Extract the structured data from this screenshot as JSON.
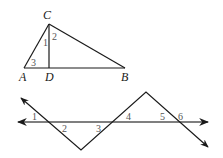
{
  "triangle": {
    "vertices": {
      "C": {
        "label": "C",
        "x": 49,
        "y": 24
      },
      "A": {
        "label": "A",
        "x": 24,
        "y": 68
      },
      "D": {
        "label": "D",
        "x": 49,
        "y": 68
      },
      "B": {
        "label": "B",
        "x": 125,
        "y": 68
      }
    },
    "angle_labels": [
      "1",
      "2",
      "3"
    ]
  },
  "transversal_figure": {
    "horizontal_line": {
      "y": 122,
      "x_start": 18,
      "x_end": 208
    },
    "zigzag_points": [
      [
        21,
        98
      ],
      [
        81,
        150
      ],
      [
        146,
        92
      ],
      [
        208,
        147
      ]
    ],
    "angle_labels": [
      "1",
      "2",
      "3",
      "4",
      "5",
      "6"
    ]
  },
  "colors": {
    "line": "#1a1a1a",
    "horizontal_line": "#555555",
    "angle_label": "#555555",
    "background": "#ffffff"
  }
}
